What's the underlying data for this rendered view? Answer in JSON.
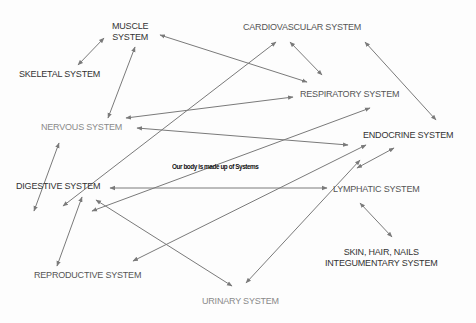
{
  "diagram": {
    "title": "Our body is made up of Systems",
    "nodes": {
      "muscle": {
        "line1": "MUSCLE",
        "line2": "SYSTEM"
      },
      "skeletal": {
        "label": "SKELETAL SYSTEM"
      },
      "cardiovascular": {
        "label": "CARDIOVASCULAR SYSTEM"
      },
      "respiratory": {
        "label": "RESPIRATORY SYSTEM"
      },
      "nervous": {
        "label": "NERVOUS SYSTEM"
      },
      "endocrine": {
        "label": "ENDOCRINE SYSTEM"
      },
      "digestive": {
        "label": "DIGESTIVE SYSTEM"
      },
      "lymphatic": {
        "label": "LYMPHATIC SYSTEM"
      },
      "skin": {
        "line1": "SKIN, HAIR, NAILS",
        "line2": "INTEGUMENTARY SYSTEM"
      },
      "reproductive": {
        "label": "REPRODUCTIVE SYSTEM"
      },
      "urinary": {
        "label": "URINARY SYSTEM"
      }
    },
    "edges": [
      {
        "from": "skeletal",
        "to": "muscle",
        "dir": "both"
      },
      {
        "from": "muscle",
        "to": "respiratory",
        "dir": "both"
      },
      {
        "from": "cardiovascular",
        "to": "respiratory",
        "dir": "both"
      },
      {
        "from": "cardiovascular",
        "to": "endocrine",
        "dir": "both"
      },
      {
        "from": "muscle",
        "to": "nervous",
        "dir": "both"
      },
      {
        "from": "cardiovascular",
        "to": "digestive",
        "dir": "both"
      },
      {
        "from": "respiratory",
        "to": "nervous",
        "dir": "both"
      },
      {
        "from": "nervous",
        "to": "endocrine",
        "dir": "both"
      },
      {
        "from": "respiratory",
        "to": "digestive",
        "dir": "both"
      },
      {
        "from": "nervous",
        "to": "digestive",
        "dir": "both"
      },
      {
        "from": "lymphatic",
        "to": "digestive",
        "dir": "both"
      },
      {
        "from": "endocrine",
        "to": "reproductive",
        "dir": "both"
      },
      {
        "from": "endocrine",
        "to": "lymphatic",
        "dir": "both"
      },
      {
        "from": "endocrine",
        "to": "urinary",
        "dir": "both"
      },
      {
        "from": "digestive",
        "to": "reproductive",
        "dir": "both"
      },
      {
        "from": "digestive",
        "to": "urinary",
        "dir": "both"
      },
      {
        "from": "lymphatic",
        "to": "skin",
        "dir": "both"
      }
    ],
    "colors": {
      "line": "#7a7a7a",
      "text": "#333333",
      "muted": "#8a8a8a"
    }
  }
}
